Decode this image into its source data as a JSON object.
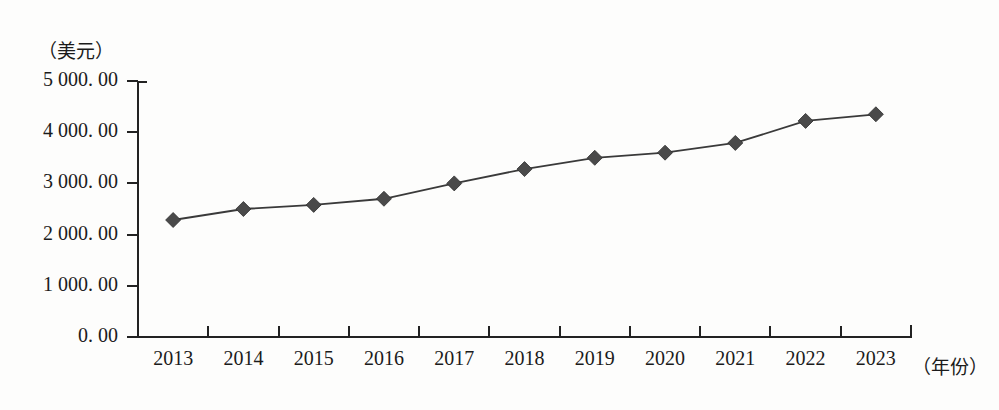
{
  "chart_data": {
    "type": "line",
    "title": "",
    "subtitle": "",
    "xlabel": "（年份）",
    "ylabel": "（美元）",
    "categories": [
      "2013",
      "2014",
      "2015",
      "2016",
      "2017",
      "2018",
      "2019",
      "2020",
      "2021",
      "2022",
      "2023"
    ],
    "values": [
      2285.0,
      2500.0,
      2580.0,
      2700.0,
      3000.0,
      3280.0,
      3500.0,
      3600.0,
      3790.0,
      4220.0,
      4350.0
    ],
    "series": [
      {
        "name": "",
        "values": [
          2285.0,
          2500.0,
          2580.0,
          2700.0,
          3000.0,
          3280.0,
          3500.0,
          3600.0,
          3790.0,
          4220.0,
          4350.0
        ]
      }
    ],
    "ylim": [
      0,
      5000
    ],
    "ytick_labels": [
      "5 000. 00",
      "4 000. 00",
      "3 000. 00",
      "2 000. 00",
      "1 000. 00",
      "0. 00"
    ],
    "ytick_values": [
      5000,
      4000,
      3000,
      2000,
      1000,
      0
    ],
    "grid": false,
    "legend": null,
    "legend_position": "none",
    "marker": "diamond",
    "line_color": "#3a3a3a",
    "marker_color": "#4a4a4a",
    "background_color": "#fdfdfc"
  }
}
